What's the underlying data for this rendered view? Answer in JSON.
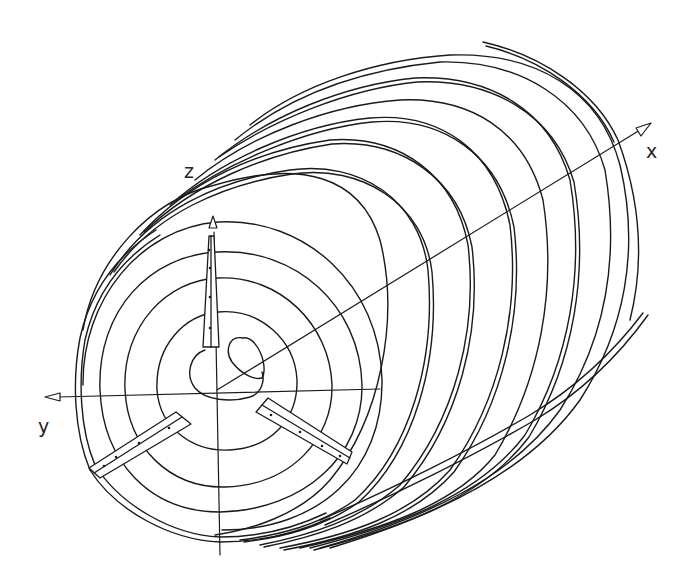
{
  "diagram": {
    "type": "3d-line-drawing",
    "axes": {
      "x": {
        "label": "x",
        "direction": "up-right (depth)"
      },
      "y": {
        "label": "y",
        "direction": "left"
      },
      "z": {
        "label": "z",
        "direction": "up"
      }
    },
    "stroke_color": "#1a1a1a",
    "background_color": "#ffffff",
    "front_rings_count": 5,
    "coil_turns_visible": 9,
    "vanes": [
      {
        "name": "vane-up",
        "angle_deg": 90
      },
      {
        "name": "vane-lower-left",
        "angle_deg": 210
      },
      {
        "name": "vane-lower-right",
        "angle_deg": 330
      }
    ]
  }
}
